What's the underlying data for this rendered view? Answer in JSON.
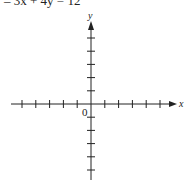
{
  "equation": "–  3x + 4y = 12",
  "axes": {
    "x_label": "x",
    "y_label": "y",
    "origin_label": "0",
    "x_ticks_each_side": 5,
    "y_ticks_each_side": 5
  }
}
